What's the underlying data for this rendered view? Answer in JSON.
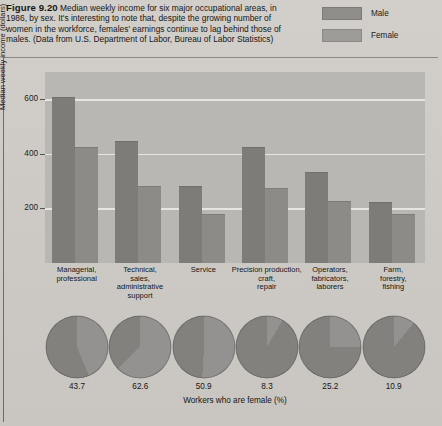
{
  "figure": {
    "number": "Figure 9.20",
    "caption": " Median weekly income for six major occupational areas, in 1986, by sex. It's interesting to note that, despite the growing number of women in the workforce, females' earnings continue to lag behind those of males. (Data from U.S. Department of Labor, Bureau of Labor Statistics)"
  },
  "legend": {
    "items": [
      {
        "label": "Male",
        "color": "#7e7c79"
      },
      {
        "label": "Female",
        "color": "#8d8b87"
      }
    ]
  },
  "chart_data": {
    "type": "bar",
    "title": "Median weekly income for six major occupational areas, in 1986, by sex",
    "xlabel": "",
    "ylabel": "Median weekly income (dollars)",
    "ylim": [
      0,
      700
    ],
    "yticks": [
      200,
      400,
      600
    ],
    "ytick_labels": [
      "200",
      "400",
      "600"
    ],
    "grid": true,
    "legend_position": "top-right",
    "categories": [
      "Managerial, professional",
      "Technical, sales, administrative support",
      "Service",
      "Precision production, craft, repair",
      "Operators, fabricators, laborers",
      "Farm, forestry, fishing"
    ],
    "series": [
      {
        "name": "Male",
        "color": "#7e7c79",
        "values": [
          605,
          445,
          280,
          420,
          330,
          220
        ]
      },
      {
        "name": "Female",
        "color": "#8d8b87",
        "values": [
          420,
          280,
          175,
          270,
          225,
          175
        ]
      }
    ]
  },
  "pie_panel": {
    "caption": "Workers who are female (%)",
    "type": "pie",
    "values": [
      43.7,
      62.6,
      50.9,
      8.3,
      25.2,
      10.9
    ],
    "labels": [
      "43.7",
      "62.6",
      "50.9",
      "8.3",
      "25.2",
      "10.9"
    ],
    "slice_colors": {
      "female": "#949290",
      "male": "#83817e"
    }
  }
}
